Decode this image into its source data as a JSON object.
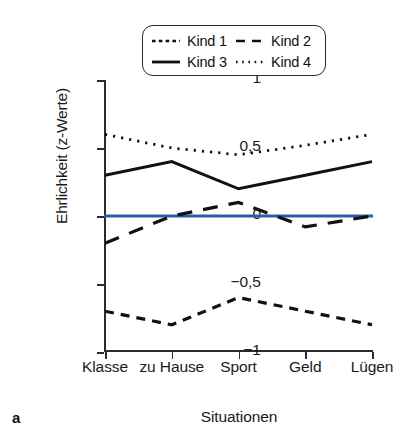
{
  "figure": {
    "panel_letter": "a"
  },
  "legend": {
    "position": "inside-top-center",
    "entries": [
      {
        "label": "Kind 1",
        "style": "short-dash",
        "color": "#111111"
      },
      {
        "label": "Kind 2",
        "style": "long-dash",
        "color": "#111111"
      },
      {
        "label": "Kind 3",
        "style": "solid",
        "color": "#111111"
      },
      {
        "label": "Kind 4",
        "style": "dotted",
        "color": "#111111"
      }
    ]
  },
  "axes": {
    "ylabel": "Ehrlichkeit (z-Werte)",
    "xlabel": "Situationen",
    "yticks": [
      "1",
      "0,5",
      "0",
      "−0,5",
      "−1"
    ],
    "xticklabels": [
      "Klasse",
      "zu Hause",
      "Sport",
      "Geld",
      "Lügen"
    ]
  },
  "reference_line": {
    "value": 0,
    "color": "#2a5caa",
    "style": "solid"
  },
  "chart_data": {
    "type": "line",
    "title": "",
    "xlabel": "Situationen",
    "ylabel": "Ehrlichkeit (z-Werte)",
    "categories": [
      "Klasse",
      "zu Hause",
      "Sport",
      "Geld",
      "Lügen"
    ],
    "ylim": [
      -1,
      1
    ],
    "yticks": [
      -1,
      -0.5,
      0,
      0.5,
      1
    ],
    "grid": false,
    "legend_position": "inside-top-center",
    "reference_line_y": 0,
    "reference_line_color": "#2a5caa",
    "series": [
      {
        "name": "Kind 1",
        "style": "short-dash",
        "color": "#111111",
        "values": [
          -0.7,
          -0.8,
          -0.6,
          -0.7,
          -0.8
        ]
      },
      {
        "name": "Kind 2",
        "style": "long-dash",
        "color": "#111111",
        "values": [
          -0.2,
          0.0,
          0.1,
          -0.08,
          0.0
        ]
      },
      {
        "name": "Kind 3",
        "style": "solid",
        "color": "#111111",
        "values": [
          0.3,
          0.4,
          0.2,
          0.3,
          0.4
        ]
      },
      {
        "name": "Kind 4",
        "style": "dotted",
        "color": "#111111",
        "values": [
          0.6,
          0.5,
          0.45,
          0.52,
          0.6
        ]
      }
    ]
  }
}
